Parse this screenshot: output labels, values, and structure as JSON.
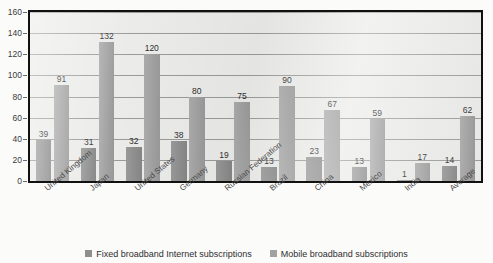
{
  "chart_data": {
    "type": "bar",
    "title": "",
    "xlabel": "",
    "ylabel": "",
    "ylim": [
      0,
      160
    ],
    "yticks": [
      0,
      20,
      40,
      60,
      80,
      100,
      120,
      140,
      160
    ],
    "grid": true,
    "legend_position": "bottom",
    "categories": [
      "United Kingdom",
      "Japan",
      "United States",
      "Germany",
      "Russian Federation",
      "Brazil",
      "China",
      "Mexico",
      "India",
      "Average"
    ],
    "series": [
      {
        "name": "Fixed broadband Internet subscriptions",
        "color": "#8e8e8e",
        "values": [
          39,
          31,
          32,
          38,
          19,
          13,
          23,
          13,
          1,
          14
        ]
      },
      {
        "name": "Mobile broadband subscriptions",
        "color": "#a2a2a2",
        "values": [
          91,
          132,
          120,
          80,
          75,
          90,
          67,
          59,
          17,
          62
        ]
      }
    ]
  },
  "legend": {
    "items": [
      {
        "label": "Fixed broadband Internet subscriptions"
      },
      {
        "label": "Mobile broadband subscriptions"
      }
    ]
  },
  "top_clip": {
    "fragment_1": "",
    "fragment_2": "",
    "fragment_3": "",
    "fragment_4": ""
  }
}
